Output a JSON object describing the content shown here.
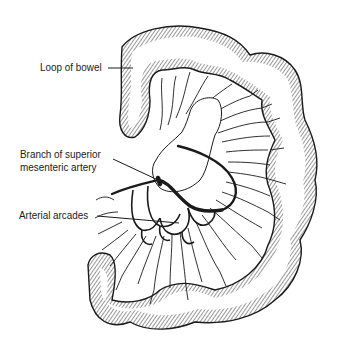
{
  "figure": {
    "labels": [
      {
        "id": "loop",
        "lines": [
          "Loop of bowel"
        ]
      },
      {
        "id": "branch",
        "lines": [
          "Branch of superior",
          "mesenteric artery"
        ]
      },
      {
        "id": "arcades",
        "lines": [
          "Arterial arcades"
        ]
      }
    ]
  },
  "colors": {
    "ink": "#1a1a1a",
    "background": "#ffffff"
  }
}
